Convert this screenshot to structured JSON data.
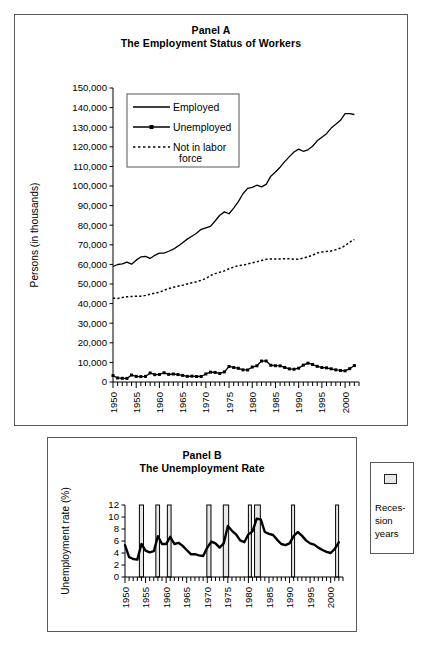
{
  "figure": {
    "background": "#ffffff",
    "line_color": "#000000"
  },
  "panel_a": {
    "title_line1": "Panel A",
    "title_line2": "The Employment Status of Workers",
    "ylabel": "Persons (in thousands)",
    "legend": {
      "employed": "Employed",
      "unemployed": "Unemployed",
      "not_in_labor_force_1": "Not in labor",
      "not_in_labor_force_2": "force"
    }
  },
  "panel_b": {
    "title_line1": "Panel B",
    "title_line2": "The Unemployment Rate",
    "ylabel": "Unemployment rate (%)",
    "legend_label_1": "Reces-",
    "legend_label_2": "sion",
    "legend_label_3": "years",
    "legend_swatch_color": "#e8e8e8"
  },
  "chart_data": [
    {
      "type": "line",
      "id": "panel-a",
      "title": "Panel A — The Employment Status of Workers",
      "xlabel": "",
      "ylabel": "Persons (in thousands)",
      "xlim": [
        1950,
        2003
      ],
      "ylim": [
        0,
        150000
      ],
      "ytick_labels": [
        "0",
        "10,000",
        "20,000",
        "30,000",
        "40,000",
        "50,000",
        "60,000",
        "70,000",
        "80,000",
        "90,000",
        "100,000",
        "110,000",
        "120,000",
        "130,000",
        "140,000",
        "150,000"
      ],
      "ytick_values": [
        0,
        10000,
        20000,
        30000,
        40000,
        50000,
        60000,
        70000,
        80000,
        90000,
        100000,
        110000,
        120000,
        130000,
        140000,
        150000
      ],
      "xtick_labels": [
        "1950",
        "1955",
        "1960",
        "1965",
        "1970",
        "1975",
        "1980",
        "1985",
        "1990",
        "1995",
        "2000"
      ],
      "xtick_values": [
        1950,
        1955,
        1960,
        1965,
        1970,
        1975,
        1980,
        1985,
        1990,
        1995,
        2000
      ],
      "minor_xticks": "annual",
      "grid": false,
      "legend_position": "upper-left-inside",
      "x": [
        1950,
        1951,
        1952,
        1953,
        1954,
        1955,
        1956,
        1957,
        1958,
        1959,
        1960,
        1961,
        1962,
        1963,
        1964,
        1965,
        1966,
        1967,
        1968,
        1969,
        1970,
        1971,
        1972,
        1973,
        1974,
        1975,
        1976,
        1977,
        1978,
        1979,
        1980,
        1981,
        1982,
        1983,
        1984,
        1985,
        1986,
        1987,
        1988,
        1989,
        1990,
        1991,
        1992,
        1993,
        1994,
        1995,
        1996,
        1997,
        1998,
        1999,
        2000,
        2001,
        2002
      ],
      "series": [
        {
          "name": "Employed",
          "style": "solid",
          "values": [
            58918,
            59961,
            60250,
            61179,
            60109,
            62170,
            63799,
            64071,
            63036,
            64630,
            65778,
            65746,
            66702,
            67762,
            69305,
            71088,
            72895,
            74372,
            75920,
            77902,
            78678,
            79367,
            82153,
            85064,
            86794,
            85846,
            88752,
            92017,
            96048,
            98824,
            99303,
            100397,
            99526,
            100834,
            105005,
            107150,
            109597,
            112440,
            114968,
            117342,
            118793,
            117718,
            118492,
            120259,
            123060,
            124900,
            126708,
            129558,
            131463,
            133488,
            136891,
            136933,
            136485
          ]
        },
        {
          "name": "Unemployed",
          "style": "solid-markers",
          "values": [
            3288,
            2055,
            1883,
            1834,
            3532,
            2852,
            2750,
            2859,
            4602,
            3740,
            3852,
            4714,
            3911,
            4070,
            3786,
            3366,
            2875,
            2975,
            2817,
            2832,
            4093,
            5016,
            4882,
            4365,
            5156,
            7929,
            7406,
            6991,
            6202,
            6137,
            7637,
            8273,
            10678,
            10717,
            8539,
            8312,
            8237,
            7425,
            6701,
            6528,
            7047,
            8628,
            9613,
            8940,
            7996,
            7404,
            7236,
            6739,
            6210,
            5880,
            5692,
            6801,
            8378
          ]
        },
        {
          "name": "Not in labor force",
          "style": "dotted",
          "values": [
            42787,
            42604,
            43093,
            43448,
            43678,
            43699,
            43800,
            44200,
            44800,
            45300,
            45800,
            46800,
            47700,
            48300,
            48900,
            49400,
            50000,
            50600,
            51200,
            51900,
            52800,
            54300,
            55300,
            56000,
            56700,
            57800,
            58600,
            59400,
            59600,
            60200,
            60800,
            61400,
            62000,
            62600,
            62800,
            62800,
            62800,
            62900,
            62900,
            62600,
            62700,
            63200,
            63900,
            64700,
            65800,
            66300,
            66600,
            66800,
            67500,
            68400,
            69500,
            71400,
            72700
          ]
        }
      ]
    },
    {
      "type": "line",
      "id": "panel-b",
      "title": "Panel B — The Unemployment Rate",
      "xlabel": "",
      "ylabel": "Unemployment rate (%)",
      "xlim": [
        1950,
        2003
      ],
      "ylim": [
        0,
        12
      ],
      "ytick_labels": [
        "0",
        "2",
        "4",
        "6",
        "8",
        "10",
        "12"
      ],
      "ytick_values": [
        0,
        2,
        4,
        6,
        8,
        10,
        12
      ],
      "xtick_labels": [
        "1950",
        "1955",
        "1960",
        "1965",
        "1970",
        "1975",
        "1980",
        "1985",
        "1990",
        "1995",
        "2000"
      ],
      "xtick_values": [
        1950,
        1955,
        1960,
        1965,
        1970,
        1975,
        1980,
        1985,
        1990,
        1995,
        2000
      ],
      "minor_xticks": "annual",
      "grid": false,
      "legend_position": "outside-right",
      "x": [
        1950,
        1951,
        1952,
        1953,
        1954,
        1955,
        1956,
        1957,
        1958,
        1959,
        1960,
        1961,
        1962,
        1963,
        1964,
        1965,
        1966,
        1967,
        1968,
        1969,
        1970,
        1971,
        1972,
        1973,
        1974,
        1975,
        1976,
        1977,
        1978,
        1979,
        1980,
        1981,
        1982,
        1983,
        1984,
        1985,
        1986,
        1987,
        1988,
        1989,
        1990,
        1991,
        1992,
        1993,
        1994,
        1995,
        1996,
        1997,
        1998,
        1999,
        2000,
        2001,
        2002
      ],
      "series": [
        {
          "name": "Unemployment rate",
          "style": "solid-thick",
          "values": [
            5.3,
            3.3,
            3.0,
            2.9,
            5.5,
            4.4,
            4.1,
            4.3,
            6.8,
            5.5,
            5.5,
            6.7,
            5.5,
            5.7,
            5.2,
            4.5,
            3.8,
            3.8,
            3.6,
            3.5,
            4.9,
            5.9,
            5.6,
            4.9,
            5.6,
            8.5,
            7.7,
            7.1,
            6.1,
            5.8,
            7.1,
            7.6,
            9.7,
            9.6,
            7.5,
            7.2,
            7.0,
            6.2,
            5.5,
            5.3,
            5.6,
            6.8,
            7.5,
            6.9,
            6.1,
            5.6,
            5.4,
            4.9,
            4.5,
            4.2,
            4.0,
            4.7,
            5.8
          ]
        }
      ],
      "recession_bands": [
        {
          "start": 1953.5,
          "end": 1954.5
        },
        {
          "start": 1957.5,
          "end": 1958.4
        },
        {
          "start": 1960.3,
          "end": 1961.2
        },
        {
          "start": 1969.9,
          "end": 1970.9
        },
        {
          "start": 1973.9,
          "end": 1975.2
        },
        {
          "start": 1980.0,
          "end": 1980.6
        },
        {
          "start": 1981.5,
          "end": 1982.9
        },
        {
          "start": 1990.5,
          "end": 1991.2
        },
        {
          "start": 2001.2,
          "end": 2001.9
        }
      ]
    }
  ]
}
